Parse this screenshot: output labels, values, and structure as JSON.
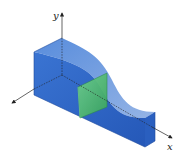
{
  "figure": {
    "axes": {
      "x_label": "x",
      "y_label": "y"
    },
    "colors": {
      "solid_front": "#2f64c4",
      "solid_top": "#5a8ad8",
      "solid_side": "#3b70cc",
      "slice": "#4fbf6a",
      "axis": "#222222"
    }
  }
}
